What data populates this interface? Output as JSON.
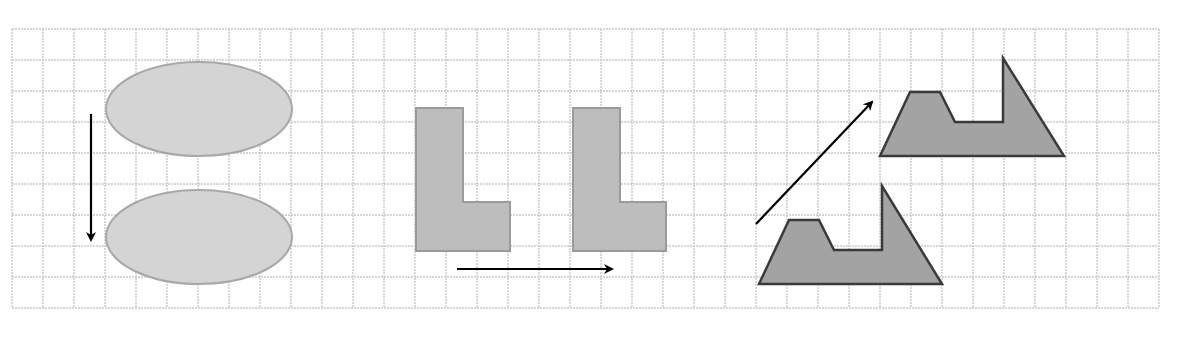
{
  "figure": {
    "title": "Translations on a square grid",
    "background": "#ffffff"
  },
  "grid": {
    "x0": 12,
    "y0": 29,
    "cell": 31,
    "cols": 37,
    "rows": 9,
    "line_color": "#c8c8c8"
  },
  "colors": {
    "ellipse_fill": "#d4d4d4",
    "ellipse_stroke": "#a8a8a8",
    "lshape_fill": "#bdbdbd",
    "lshape_stroke": "#9a9a9a",
    "trap_fill": "#a3a3a3",
    "trap_stroke": "#3a3a3a",
    "arrow": "#000000"
  },
  "examples": [
    {
      "name": "ellipse-translation",
      "direction": "down",
      "original": {
        "cx": 199,
        "cy": 109,
        "rx": 93,
        "ry": 47
      },
      "image": {
        "cx": 199,
        "cy": 237,
        "rx": 93,
        "ry": 47
      },
      "arrow": {
        "x1": 91,
        "y1": 114,
        "x2": 91,
        "y2": 240
      }
    },
    {
      "name": "l-shape-translation",
      "direction": "right",
      "original": "416,108 463,108 463,202 510,202 510,251 416,251",
      "image": "573,108 620,108 620,202 666,202 666,251 573,251",
      "arrow": {
        "x1": 457,
        "y1": 269,
        "x2": 612,
        "y2": 269
      }
    },
    {
      "name": "trapezoid-translation",
      "direction": "up-right",
      "original": "759,284 789,220 819,220 834,250 882,250 882,186 942,284",
      "image": "880,156 910,92 940,92 955,122 1003,122 1003,58 1064,156",
      "arrow": {
        "x1": 756,
        "y1": 224,
        "x2": 872,
        "y2": 102
      }
    }
  ]
}
